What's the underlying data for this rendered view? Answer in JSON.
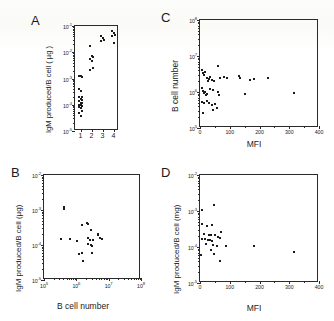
{
  "figure": {
    "kind": "four-panel-scatter-figure",
    "background": "#ffffff",
    "ink": "#1c1c1c"
  },
  "panels": {
    "a": {
      "letter": "A",
      "ylabel": "IgM produced/B cell ( µg )",
      "xlabel": "",
      "yticks": [
        "10-1",
        "10-2",
        "10-3",
        "10-4",
        "10-5"
      ],
      "xticks": [
        "1",
        "2",
        "3",
        "4"
      ]
    },
    "b": {
      "letter": "B",
      "ylabel": "IgM produced/B cell (µg)",
      "xlabel": "B cell number",
      "yticks": [
        "10-2",
        "10-3",
        "10-4",
        "10-5"
      ],
      "xticks": [
        "105",
        "106",
        "107",
        "108"
      ]
    },
    "c": {
      "letter": "C",
      "ylabel": "B cell number",
      "xlabel": "MFI",
      "yticks": [
        "108",
        "107",
        "106",
        "105"
      ],
      "xticks": [
        "0",
        "100",
        "200",
        "300",
        "400"
      ]
    },
    "d": {
      "letter": "D",
      "ylabel": "IgM produced/B cell (mg)",
      "xlabel": "MFI",
      "yticks": [
        "10-2",
        "10-3",
        "10-4",
        "10-5"
      ],
      "xticks": [
        "0",
        "100",
        "200",
        "300",
        "400"
      ]
    }
  },
  "chart_data": [
    {
      "id": "panel-a",
      "type": "scatter",
      "title": "A",
      "xlabel": "",
      "ylabel": "IgM produced/B cell ( µg )",
      "xscale": "category",
      "yscale": "log",
      "ylim": [
        1e-05,
        0.1
      ],
      "xticklabels": [
        "1",
        "2",
        "3",
        "4"
      ],
      "yticklabels": [
        "10^-1",
        "10^-2",
        "10^-3",
        "10^-4",
        "10^-5"
      ],
      "grid": false,
      "legend": "none",
      "series": [
        {
          "name": "group 1",
          "x": [
            1,
            1,
            1,
            1,
            1,
            1,
            1,
            1,
            1,
            1,
            1,
            1,
            1,
            1,
            1,
            1,
            1,
            1,
            1,
            1
          ],
          "y": [
            0.0013,
            0.0012,
            0.00115,
            0.0004,
            0.00034,
            0.0002,
            0.00019,
            0.00016,
            0.00015,
            0.00014,
            0.00012,
            0.000115,
            0.0001,
            9.5e-05,
            9e-05,
            8e-05,
            7.5e-05,
            6e-05,
            5e-05,
            3.6e-05
          ]
        },
        {
          "name": "group 2",
          "x": [
            2,
            2,
            2,
            2,
            2,
            2,
            2
          ],
          "y": [
            0.017,
            0.0075,
            0.0065,
            0.0055,
            0.0046,
            0.0026,
            0.0022
          ]
        },
        {
          "name": "group 3",
          "x": [
            3,
            3,
            3,
            3
          ],
          "y": [
            0.042,
            0.036,
            0.03,
            0.026
          ]
        },
        {
          "name": "group 4",
          "x": [
            4,
            4,
            4,
            4,
            4
          ],
          "y": [
            0.062,
            0.054,
            0.046,
            0.04,
            0.023
          ]
        }
      ]
    },
    {
      "id": "panel-b",
      "type": "scatter",
      "title": "B",
      "xlabel": "B cell number",
      "ylabel": "IgM produced/B cell (µg)",
      "xscale": "log",
      "yscale": "log",
      "xlim": [
        100000.0,
        100000000.0
      ],
      "ylim": [
        1e-05,
        0.01
      ],
      "xticklabels": [
        "10^5",
        "10^6",
        "10^7",
        "10^8"
      ],
      "yticklabels": [
        "10^-2",
        "10^-3",
        "10^-4",
        "10^-5"
      ],
      "grid": false,
      "legend": "none",
      "points": [
        {
          "x": 430000.0,
          "y": 0.00125
        },
        {
          "x": 430000.0,
          "y": 0.00105
        },
        {
          "x": 1500000.0,
          "y": 0.00037
        },
        {
          "x": 2200000.0,
          "y": 0.00043
        },
        {
          "x": 2300000.0,
          "y": 0.00039
        },
        {
          "x": 2900000.0,
          "y": 0.00026
        },
        {
          "x": 4600000.0,
          "y": 0.0002
        },
        {
          "x": 4800000.0,
          "y": 0.00019
        },
        {
          "x": 340000.0,
          "y": 0.00015
        },
        {
          "x": 620000.0,
          "y": 0.000145
        },
        {
          "x": 1050000.0,
          "y": 0.00013
        },
        {
          "x": 2300000.0,
          "y": 0.00016
        },
        {
          "x": 2600000.0,
          "y": 0.000135
        },
        {
          "x": 3200000.0,
          "y": 0.00014
        },
        {
          "x": 5500000.0,
          "y": 0.000155
        },
        {
          "x": 6200000.0,
          "y": 0.00015
        },
        {
          "x": 2300000.0,
          "y": 0.000105
        },
        {
          "x": 2800000.0,
          "y": 0.0001
        },
        {
          "x": 3000000.0,
          "y": 9.5e-05
        },
        {
          "x": 1500000.0,
          "y": 6e-05
        },
        {
          "x": 1250000.0,
          "y": 5.6e-05
        },
        {
          "x": 3000000.0,
          "y": 5.8e-05
        },
        {
          "x": 1600000.0,
          "y": 3.6e-05
        }
      ]
    },
    {
      "id": "panel-c",
      "type": "scatter",
      "title": "C",
      "xlabel": "MFI",
      "ylabel": "B cell number",
      "xscale": "linear",
      "yscale": "log",
      "xlim": [
        0,
        400
      ],
      "ylim": [
        100000.0,
        100000000.0
      ],
      "xticklabels": [
        "0",
        "100",
        "200",
        "300",
        "400"
      ],
      "yticklabels": [
        "10^8",
        "10^7",
        "10^6",
        "10^5"
      ],
      "grid": false,
      "legend": "none",
      "points": [
        {
          "x": 8,
          "y": 4000000.0
        },
        {
          "x": 10,
          "y": 3400000.0
        },
        {
          "x": 14,
          "y": 3000000.0
        },
        {
          "x": 18,
          "y": 3600000.0
        },
        {
          "x": 22,
          "y": 2400000.0
        },
        {
          "x": 26,
          "y": 2000000.0
        },
        {
          "x": 30,
          "y": 2300000.0
        },
        {
          "x": 34,
          "y": 2600000.0
        },
        {
          "x": 40,
          "y": 2200000.0
        },
        {
          "x": 46,
          "y": 2000000.0
        },
        {
          "x": 62,
          "y": 5200000.0
        },
        {
          "x": 68,
          "y": 2500000.0
        },
        {
          "x": 82,
          "y": 2600000.0
        },
        {
          "x": 92,
          "y": 2500000.0
        },
        {
          "x": 130,
          "y": 2800000.0
        },
        {
          "x": 136,
          "y": 2400000.0
        },
        {
          "x": 168,
          "y": 2100000.0
        },
        {
          "x": 180,
          "y": 2300000.0
        },
        {
          "x": 228,
          "y": 2400000.0
        },
        {
          "x": 6,
          "y": 1300000.0
        },
        {
          "x": 10,
          "y": 1100000.0
        },
        {
          "x": 13,
          "y": 950000.0
        },
        {
          "x": 16,
          "y": 1000000.0
        },
        {
          "x": 20,
          "y": 850000.0
        },
        {
          "x": 24,
          "y": 900000.0
        },
        {
          "x": 34,
          "y": 1200000.0
        },
        {
          "x": 44,
          "y": 1150000.0
        },
        {
          "x": 62,
          "y": 1000000.0
        },
        {
          "x": 64,
          "y": 800000.0
        },
        {
          "x": 150,
          "y": 880000.0
        },
        {
          "x": 316,
          "y": 950000.0
        },
        {
          "x": 8,
          "y": 520000.0
        },
        {
          "x": 14,
          "y": 500000.0
        },
        {
          "x": 24,
          "y": 550000.0
        },
        {
          "x": 30,
          "y": 480000.0
        },
        {
          "x": 40,
          "y": 440000.0
        },
        {
          "x": 50,
          "y": 460000.0
        },
        {
          "x": 56,
          "y": 360000.0
        },
        {
          "x": 44,
          "y": 320000.0
        },
        {
          "x": 10,
          "y": 260000.0
        }
      ]
    },
    {
      "id": "panel-d",
      "type": "scatter",
      "title": "D",
      "xlabel": "MFI",
      "ylabel": "IgM produced/B cell (mg)",
      "xscale": "linear",
      "yscale": "log",
      "xlim": [
        0,
        400
      ],
      "ylim": [
        1e-05,
        0.01
      ],
      "xticklabels": [
        "0",
        "100",
        "200",
        "300",
        "400"
      ],
      "yticklabels": [
        "10^-2",
        "10^-3",
        "10^-4",
        "10^-5"
      ],
      "grid": false,
      "legend": "none",
      "points": [
        {
          "x": 6,
          "y": 0.0011
        },
        {
          "x": 46,
          "y": 0.0015
        },
        {
          "x": 8,
          "y": 0.00044
        },
        {
          "x": 22,
          "y": 0.00039
        },
        {
          "x": 40,
          "y": 0.00041
        },
        {
          "x": 12,
          "y": 0.00023
        },
        {
          "x": 30,
          "y": 0.00022
        },
        {
          "x": 36,
          "y": 0.00021
        },
        {
          "x": 50,
          "y": 0.00022
        },
        {
          "x": 70,
          "y": 0.00026
        },
        {
          "x": 8,
          "y": 0.00017
        },
        {
          "x": 16,
          "y": 0.000165
        },
        {
          "x": 26,
          "y": 0.00016
        },
        {
          "x": 32,
          "y": 0.000155
        },
        {
          "x": 42,
          "y": 0.00015
        },
        {
          "x": 60,
          "y": 0.00019
        },
        {
          "x": 66,
          "y": 0.00018
        },
        {
          "x": 20,
          "y": 0.00012
        },
        {
          "x": 44,
          "y": 0.000115
        },
        {
          "x": 56,
          "y": 0.00011
        },
        {
          "x": 88,
          "y": 0.000105
        },
        {
          "x": 180,
          "y": 0.000105
        },
        {
          "x": 316,
          "y": 7.2e-05
        },
        {
          "x": 4,
          "y": 6e-05
        },
        {
          "x": 48,
          "y": 6.2e-05
        },
        {
          "x": 38,
          "y": 8.5e-05
        },
        {
          "x": 68,
          "y": 4e-05
        }
      ]
    }
  ]
}
